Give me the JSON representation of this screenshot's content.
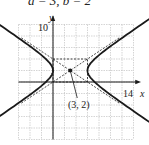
{
  "caption": "a = 3, b = 2",
  "chart_data": {
    "type": "line",
    "title": "a = 3, b = 2",
    "xlabel": "x",
    "ylabel": "y",
    "xlim": [
      -6,
      14
    ],
    "ylim": [
      -10,
      10
    ],
    "x_tick_labels": [
      "14"
    ],
    "y_tick_labels": [
      "10"
    ],
    "grid": true,
    "center": {
      "x": 3,
      "y": 2,
      "label": "(3, 2)"
    },
    "a": 3,
    "b": 2,
    "vertices": [
      [
        0,
        2
      ],
      [
        6,
        2
      ]
    ],
    "asymptotes": [
      "y - 2 = (2/3)(x - 3)",
      "y - 2 = -(2/3)(x - 3)"
    ],
    "rectangle": {
      "x": [
        0,
        6
      ],
      "y": [
        0,
        4
      ]
    },
    "series": [
      {
        "name": "right branch",
        "style": "solid"
      },
      {
        "name": "left branch",
        "style": "solid"
      },
      {
        "name": "asymptotes",
        "style": "dashed"
      }
    ]
  },
  "labels": {
    "y_axis": "y",
    "x_axis": "x",
    "y_tick": "10",
    "x_tick": "14",
    "center_label": "(3, 2)"
  },
  "colors": {
    "curve": "#1a1a1a",
    "grid": "#b8b8b8",
    "axis": "#1a1a1a"
  }
}
